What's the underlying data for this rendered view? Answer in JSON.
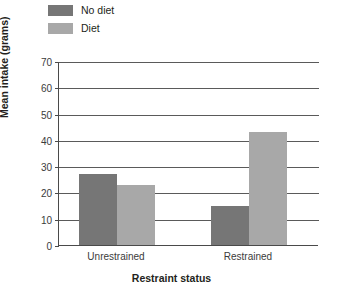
{
  "chart_data": {
    "type": "bar",
    "title": "",
    "xlabel": "Restraint status",
    "ylabel": "Mean intake (grams)",
    "categories": [
      "Unrestrained",
      "Restrained"
    ],
    "series": [
      {
        "name": "No diet",
        "color": "#767676",
        "values": [
          27,
          15
        ]
      },
      {
        "name": "Diet",
        "color": "#a8a8a8",
        "values": [
          23,
          43
        ]
      }
    ],
    "ylim": [
      0,
      70
    ],
    "ytick_step": 10,
    "yticks": [
      0,
      10,
      20,
      30,
      40,
      50,
      60,
      70
    ],
    "ytick_labels": [
      "0",
      "10",
      "20",
      "30",
      "40",
      "50",
      "60",
      "70"
    ],
    "grid": true,
    "grid_axis": "y",
    "legend_position": "top-left"
  },
  "legend": {
    "items": [
      {
        "label": "No diet",
        "color": "#767676"
      },
      {
        "label": "Diet",
        "color": "#a8a8a8"
      }
    ]
  },
  "axes": {
    "y_title": "Mean intake (grams)",
    "x_title": "Restraint status"
  }
}
